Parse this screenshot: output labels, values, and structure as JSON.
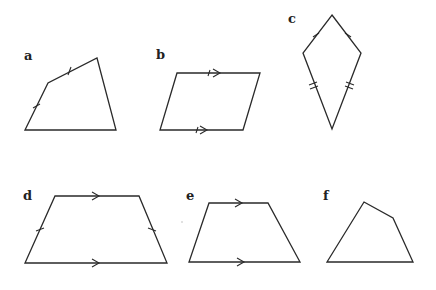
{
  "figure": {
    "shapes": [
      {
        "id": "a",
        "label": "a",
        "type": "quadrilateral",
        "marks": "single ticks on two adjacent sides"
      },
      {
        "id": "b",
        "label": "b",
        "type": "parallelogram",
        "marks": "single arrows on top and bottom sides with ticks"
      },
      {
        "id": "c",
        "label": "c",
        "type": "kite",
        "marks": "single ticks on upper sides, double ticks on lower sides"
      },
      {
        "id": "d",
        "label": "d",
        "type": "isosceles trapezium",
        "marks": "arrows on parallel sides, ticks on legs"
      },
      {
        "id": "e",
        "label": "e",
        "type": "trapezium",
        "marks": "arrows on parallel sides"
      },
      {
        "id": "f",
        "label": "f",
        "type": "quadrilateral",
        "marks": "none"
      }
    ]
  }
}
